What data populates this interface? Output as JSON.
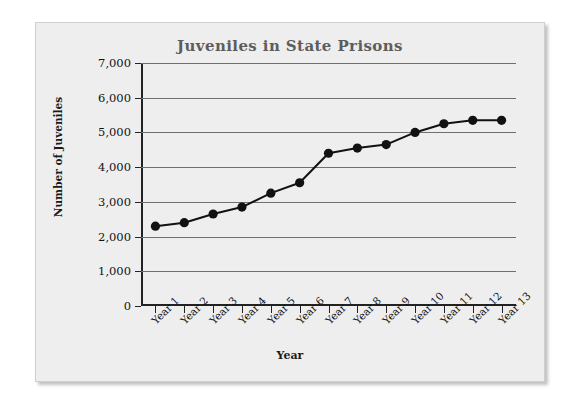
{
  "chart_data": {
    "type": "line",
    "title": "Juveniles in State Prisons",
    "xlabel": "Year",
    "ylabel": "Number of Juveniles",
    "categories": [
      "Year 1",
      "Year 2",
      "Year 3",
      "Year 4",
      "Year 5",
      "Year 6",
      "Year 7",
      "Year 8",
      "Year 9",
      "Year 10",
      "Year 11",
      "Year 12",
      "Year 13"
    ],
    "values": [
      2300,
      2400,
      2650,
      2850,
      3250,
      3550,
      4400,
      4550,
      4650,
      5000,
      5250,
      5350,
      5350
    ],
    "ylim": [
      0,
      7000
    ],
    "ytick_labels": [
      "7,000",
      "6,000",
      "5,000",
      "4,000",
      "3,000",
      "2,000",
      "1,000",
      "0"
    ],
    "ytick_values": [
      7000,
      6000,
      5000,
      4000,
      3000,
      2000,
      1000,
      0
    ],
    "grid": true,
    "legend": null,
    "marker": "circle",
    "series_color": "#111111",
    "title_color": "#5d5d5d",
    "grid_color": "#6f6f6f",
    "plot_background": "#eeeeee"
  }
}
